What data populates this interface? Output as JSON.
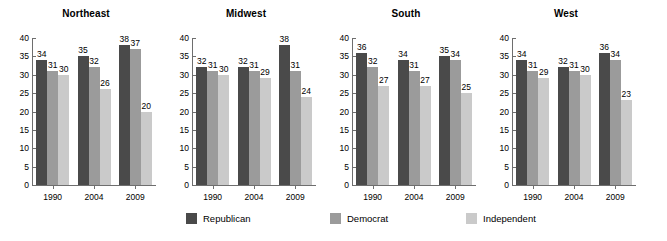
{
  "chart_data": {
    "type": "bar",
    "title": "",
    "xlabel": "",
    "ylabel": "",
    "ylim": [
      0,
      40
    ],
    "ytick_step": 5,
    "yticks": [
      40,
      35,
      30,
      25,
      20,
      15,
      10,
      5,
      0
    ],
    "grid": false,
    "legend_position": "bottom",
    "categories": [
      "1990",
      "2004",
      "2009"
    ],
    "series_names": [
      "Republican",
      "Democrat",
      "Independent"
    ],
    "series_colors": [
      "#4a4a4a",
      "#9b9b9b",
      "#cacaca"
    ],
    "panels": [
      {
        "title": "Northeast",
        "categories": [
          "1990",
          "2004",
          "2009"
        ],
        "series": [
          {
            "name": "Republican",
            "color": "#4a4a4a",
            "values": [
              34,
              35,
              38
            ]
          },
          {
            "name": "Democrat",
            "color": "#9b9b9b",
            "values": [
              31,
              32,
              37
            ]
          },
          {
            "name": "Independent",
            "color": "#cacaca",
            "values": [
              30,
              26,
              20
            ]
          }
        ]
      },
      {
        "title": "Midwest",
        "categories": [
          "1990",
          "2004",
          "2009"
        ],
        "series": [
          {
            "name": "Republican",
            "color": "#4a4a4a",
            "values": [
              32,
              32,
              38
            ]
          },
          {
            "name": "Democrat",
            "color": "#9b9b9b",
            "values": [
              31,
              31,
              31
            ]
          },
          {
            "name": "Independent",
            "color": "#cacaca",
            "values": [
              30,
              29,
              24
            ]
          }
        ]
      },
      {
        "title": "South",
        "categories": [
          "1990",
          "2004",
          "2009"
        ],
        "series": [
          {
            "name": "Republican",
            "color": "#4a4a4a",
            "values": [
              36,
              34,
              35
            ]
          },
          {
            "name": "Democrat",
            "color": "#9b9b9b",
            "values": [
              32,
              31,
              34
            ]
          },
          {
            "name": "Independent",
            "color": "#cacaca",
            "values": [
              27,
              27,
              25
            ]
          }
        ]
      },
      {
        "title": "West",
        "categories": [
          "1990",
          "2004",
          "2009"
        ],
        "series": [
          {
            "name": "Republican",
            "color": "#4a4a4a",
            "values": [
              34,
              32,
              36
            ]
          },
          {
            "name": "Democrat",
            "color": "#9b9b9b",
            "values": [
              31,
              31,
              34
            ]
          },
          {
            "name": "Independent",
            "color": "#cacaca",
            "values": [
              29,
              30,
              23
            ]
          }
        ]
      }
    ]
  },
  "legend": {
    "items": [
      {
        "label": "Republican",
        "color": "#4a4a4a",
        "key": "rep"
      },
      {
        "label": "Democrat",
        "color": "#9b9b9b",
        "key": "dem"
      },
      {
        "label": "Independent",
        "color": "#cacaca",
        "key": "ind"
      }
    ]
  }
}
